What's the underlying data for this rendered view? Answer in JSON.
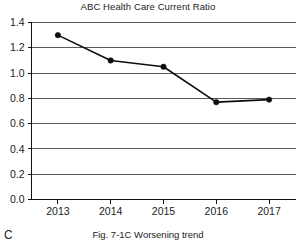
{
  "chart_data": {
    "type": "line",
    "title": "ABC Health Care Current Ratio",
    "xlabel": "",
    "ylabel": "",
    "categories": [
      "2013",
      "2014",
      "2015",
      "2016",
      "2017"
    ],
    "values": [
      1.3,
      1.1,
      1.05,
      0.77,
      0.79
    ],
    "series": [
      {
        "name": "Current Ratio",
        "values": [
          1.3,
          1.1,
          1.05,
          0.77,
          0.79
        ]
      }
    ],
    "ylim": [
      0.0,
      1.4
    ],
    "ytick_labels": [
      "0.0",
      "0.2",
      "0.4",
      "0.6",
      "0.8",
      "1.0",
      "1.2",
      "1.4"
    ],
    "ytick_values": [
      0.0,
      0.2,
      0.4,
      0.6,
      0.8,
      1.0,
      1.2,
      1.4
    ],
    "grid": true,
    "grid_orientation": "horizontal",
    "legend": false,
    "legend_position": "none",
    "marker": "filled-circle",
    "line_color": "#0d0d0d",
    "grid_color": "#5a5a5a",
    "axis_color": "#111111"
  },
  "figure": {
    "panel_letter": "C",
    "caption": "Fig. 7-1C Worsening trend"
  }
}
